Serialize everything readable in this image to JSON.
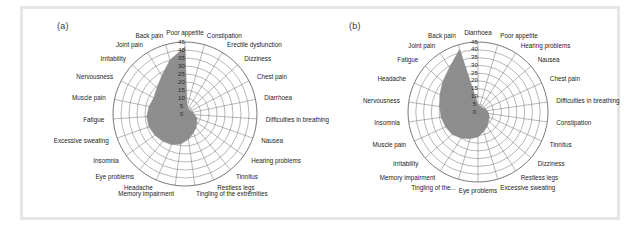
{
  "figure": {
    "background": "#ffffff",
    "border_color": "#e6e6e6",
    "series_color": "#8a8a8a",
    "grid_color": "#7a7a7a"
  },
  "panels": [
    {
      "id": "a",
      "label": "(a)"
    },
    {
      "id": "b",
      "label": "(b)"
    }
  ],
  "chart_data": [
    {
      "type": "radar",
      "panel": "(a)",
      "title": "",
      "xlabel": "",
      "ylabel": "",
      "rlim": [
        0,
        45
      ],
      "tick_labels": [
        "0",
        "5",
        "10",
        "15",
        "20",
        "25",
        "30",
        "35",
        "40",
        "45"
      ],
      "tick_values": [
        0,
        5,
        10,
        15,
        20,
        25,
        30,
        35,
        40,
        45
      ],
      "grid": true,
      "legend": "none",
      "start_angle_deg": 90,
      "direction": "clockwise",
      "categories": [
        "Poor appetite",
        "Constipation",
        "Erectile dysfunction",
        "Dizziness",
        "Chest pain",
        "Diarrhoea",
        "Difficulties in breathing",
        "Nausea",
        "Hearing problems",
        "Tinnitus",
        "Restless legs",
        "Tingling of the extremities",
        "Memory impairment",
        "Headache",
        "Eye problems",
        "Insomnia",
        "Excessive sweating",
        "Fatigue",
        "Muscle pain",
        "Nervousness",
        "Irritability",
        "Joint pain",
        "Back pain"
      ],
      "values": [
        42,
        5,
        4,
        4,
        4,
        5,
        6,
        8,
        9,
        11,
        13,
        16,
        19,
        21,
        22,
        23,
        24,
        24,
        23,
        22,
        24,
        28,
        35
      ]
    },
    {
      "type": "radar",
      "panel": "(b)",
      "title": "",
      "xlabel": "",
      "ylabel": "",
      "rlim": [
        0,
        45
      ],
      "tick_labels": [
        "0",
        "5",
        "10",
        "15",
        "20",
        "25",
        "30",
        "35",
        "40",
        "45"
      ],
      "tick_values": [
        0,
        5,
        10,
        15,
        20,
        25,
        30,
        35,
        40,
        45
      ],
      "grid": true,
      "legend": "none",
      "start_angle_deg": 90,
      "direction": "clockwise",
      "categories": [
        "Diarrhoea",
        "Poor appetite",
        "Hearing problems",
        "Nausea",
        "Chest pain",
        "Difficulties in breathing",
        "Constipation",
        "Tinnitus",
        "Dizziness",
        "Restless legs",
        "Excessive sweating",
        "Eye problems",
        "Tingling of the...",
        "Memory impairment",
        "Irritability",
        "Muscle pain",
        "Insomnia",
        "Nervousness",
        "Headache",
        "Fatigue",
        "Joint pain",
        "Back pain"
      ],
      "values": [
        5,
        4,
        4,
        4,
        5,
        6,
        7,
        8,
        9,
        11,
        13,
        16,
        18,
        20,
        22,
        23,
        24,
        25,
        27,
        30,
        34,
        42
      ]
    }
  ]
}
